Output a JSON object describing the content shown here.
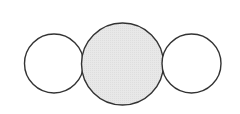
{
  "diagram": {
    "background": "#ffffff",
    "stroke_color": "#333333",
    "stroke_width": 1.4,
    "circles": [
      {
        "name": "left-circle",
        "cx": 54,
        "cy": 63.5,
        "r": 29.5,
        "fill": "#ffffff"
      },
      {
        "name": "center-circle",
        "cx": 122.5,
        "cy": 64,
        "r": 41,
        "fill": "#e6e6e6"
      },
      {
        "name": "right-circle",
        "cx": 191.5,
        "cy": 63.5,
        "r": 29.5,
        "fill": "#ffffff"
      }
    ]
  }
}
